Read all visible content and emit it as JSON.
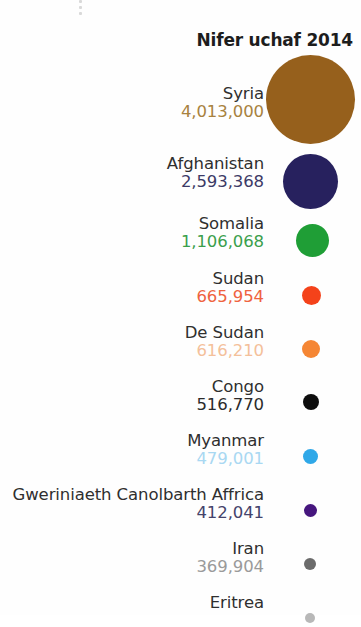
{
  "chart_data": {
    "type": "bubble",
    "title": "Nifer uchaf 2014",
    "xlabel": "",
    "ylabel": "",
    "grid": false,
    "legend": "none",
    "categories": [
      "Syria",
      "Afghanistan",
      "Somalia",
      "Sudan",
      "De Sudan",
      "Congo",
      "Myanmar",
      "Gweriniaeth Canolbarth Affrica",
      "Iran",
      "Eritrea"
    ],
    "values": [
      4013000,
      2593368,
      1106068,
      665954,
      616210,
      516770,
      479001,
      412041,
      369904,
      null
    ],
    "value_labels": [
      "4,013,000",
      "2,593,368",
      "1,106,068",
      "665,954",
      "616,210",
      "516,770",
      "479,001",
      "412,041",
      "369,904",
      ""
    ],
    "colors": [
      "#96601c",
      "#27215e",
      "#1f9e36",
      "#f4421a",
      "#f58634",
      "#0d0d0d",
      "#2fa8e8",
      "#46167e",
      "#6b6b6b",
      "#b8b8b8"
    ],
    "bubble_diameters_px": [
      89,
      55,
      33,
      19,
      18,
      16,
      15,
      13,
      12,
      10
    ]
  },
  "title": {
    "text": "Nifer uchaf 2014"
  },
  "rows": [
    {
      "country": "Syria",
      "value": "4,013,000",
      "color": "#96601c",
      "value_color": "#a8823f"
    },
    {
      "country": "Afghanistan",
      "value": "2,593,368",
      "color": "#27215e",
      "value_color": "#3c3a66"
    },
    {
      "country": "Somalia",
      "value": "1,106,068",
      "color": "#1f9e36",
      "value_color": "#3a9f4c"
    },
    {
      "country": "Sudan",
      "value": "665,954",
      "color": "#f4421a",
      "value_color": "#ef6240"
    },
    {
      "country": "De Sudan",
      "value": "616,210",
      "color": "#f58634",
      "value_color": "#f4c09a"
    },
    {
      "country": "Congo",
      "value": "516,770",
      "color": "#0d0d0d",
      "value_color": "#2b2b2b"
    },
    {
      "country": "Myanmar",
      "value": "479,001",
      "color": "#2fa8e8",
      "value_color": "#a9d8f2"
    },
    {
      "country": "Gweriniaeth Canolbarth Affrica",
      "value": "412,041",
      "color": "#46167e",
      "value_color": "#44436b"
    },
    {
      "country": "Iran",
      "value": "369,904",
      "color": "#6b6b6b",
      "value_color": "#9a9a9a"
    },
    {
      "country": "Eritrea",
      "value": "",
      "color": "#b8b8b8",
      "value_color": "#b8b8b8"
    }
  ],
  "artifacts": {
    "ellipsis_dots": 3
  }
}
